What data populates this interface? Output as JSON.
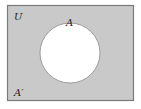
{
  "diagram": {
    "type": "venn",
    "universe_label": "U",
    "set_label": "A",
    "complement_label": "A′",
    "shaded_region": "complement of A",
    "colors": {
      "shaded": "#c9c9c9",
      "border": "#7a7a7a",
      "circle_fill": "#ffffff",
      "text": "#222222"
    }
  }
}
